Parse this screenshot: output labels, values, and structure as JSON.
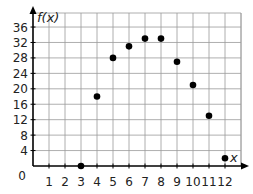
{
  "chart_data": {
    "type": "scatter",
    "title": "",
    "xlabel": "x",
    "ylabel": "f(x)",
    "x": [
      3,
      4,
      5,
      6,
      7,
      8,
      9,
      10,
      11,
      12
    ],
    "values": [
      0,
      18,
      28,
      31,
      33,
      33,
      27,
      21,
      13,
      2
    ],
    "series": [
      {
        "name": "f(x)",
        "x": [
          3,
          4,
          5,
          6,
          7,
          8,
          9,
          10,
          11,
          12
        ],
        "values": [
          0,
          18,
          28,
          31,
          33,
          33,
          27,
          21,
          13,
          2
        ]
      }
    ],
    "xlim": [
      0,
      13
    ],
    "ylim": [
      0,
      38
    ],
    "x_ticks": [
      "1",
      "2",
      "3",
      "4",
      "5",
      "6",
      "7",
      "8",
      "9",
      "10",
      "11",
      "12"
    ],
    "y_ticks": [
      "4",
      "8",
      "12",
      "16",
      "20",
      "24",
      "28",
      "32",
      "36"
    ],
    "origin_label": "0",
    "grid": true,
    "legend": null
  },
  "colors": {
    "grid": "#9a9a9a",
    "axis": "#000000",
    "point": "#000000",
    "text": "#222222"
  }
}
